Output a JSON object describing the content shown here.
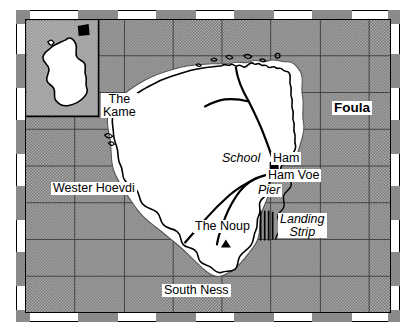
{
  "map": {
    "title": "Foula",
    "region_label": "Foula",
    "inset": {
      "name": "great-britain-inset",
      "locator_marker": "filled-square"
    },
    "sea_fill_color": "#9a9a9a",
    "land_fill_color": "#ffffff",
    "coastline_color": "#000000",
    "grid_color": "#3a3a3a",
    "frame_color": "#000000",
    "labels": [
      {
        "id": "foula",
        "text": "Foula",
        "style": "bold",
        "x": 330,
        "y": 98,
        "lines": [
          "Foula"
        ]
      },
      {
        "id": "the-kame",
        "text": "The Kame",
        "style": "plain",
        "x": 99,
        "y": 92,
        "lines": [
          "The",
          "Kame"
        ]
      },
      {
        "id": "wester-hoevdi",
        "text": "Wester Hoevdi",
        "style": "plain",
        "x": 49,
        "y": 180,
        "lines": [
          "Wester Hoevdi"
        ]
      },
      {
        "id": "school",
        "text": "School",
        "style": "italic",
        "x": 218,
        "y": 148,
        "lines": [
          "School"
        ]
      },
      {
        "id": "ham",
        "text": "Ham",
        "style": "plain",
        "x": 268,
        "y": 148,
        "lines": [
          "Ham"
        ]
      },
      {
        "id": "ham-voe",
        "text": "Ham Voe",
        "style": "plain",
        "x": 262,
        "y": 164,
        "lines": [
          "Ham Voe"
        ]
      },
      {
        "id": "pier",
        "text": "Pier",
        "style": "italic",
        "x": 254,
        "y": 180,
        "lines": [
          "Pier"
        ]
      },
      {
        "id": "landing-strip",
        "text": "Landing Strip",
        "style": "italic",
        "x": 276,
        "y": 210,
        "lines": [
          "Landing",
          "Strip"
        ]
      },
      {
        "id": "the-noup",
        "text": "The Noup",
        "style": "plain",
        "x": 192,
        "y": 218,
        "lines": [
          "The Noup"
        ]
      },
      {
        "id": "south-ness",
        "text": "South Ness",
        "style": "plain",
        "x": 160,
        "y": 282,
        "lines": [
          "South Ness"
        ]
      }
    ],
    "symbols": [
      {
        "id": "ham-settlement",
        "name": "settlement-square-marker",
        "shape": "square",
        "x": 257,
        "y": 152,
        "size": 9
      },
      {
        "id": "noup-summit",
        "name": "summit-triangle-marker",
        "shape": "triangle",
        "x": 212,
        "y": 234,
        "size": 9
      }
    ],
    "features": {
      "landing_strip": {
        "name": "landing-strip-hatching",
        "line_count": 4
      },
      "roads": {
        "name": "road-network",
        "count": 5
      }
    },
    "grid": {
      "columns": 8,
      "rows": 8,
      "visible": true
    }
  }
}
